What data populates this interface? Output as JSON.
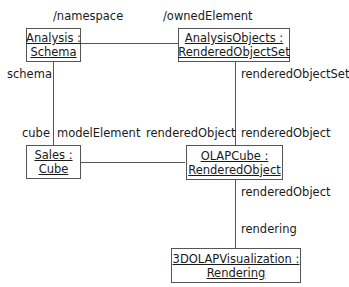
{
  "objects": [
    {
      "id": "analysis",
      "line1": "Analysis :",
      "line2": "Schema"
    },
    {
      "id": "analysis-objects",
      "line1": "AnalysisObjects :",
      "line2": "RenderedObjectSet"
    },
    {
      "id": "sales",
      "line1": "Sales :",
      "line2": "Cube"
    },
    {
      "id": "olapcube",
      "line1": "OLAPCube :",
      "line2": "RenderedObject"
    },
    {
      "id": "visualization",
      "line1": "3DOLAPVisualization :",
      "line2": "Rendering"
    }
  ],
  "roles": {
    "namespace": "/namespace",
    "owned_element": "/ownedElement",
    "schema": "schema",
    "cube": "cube",
    "model_element": "modelElement",
    "rendered_object_set": "renderedObjectSet",
    "rendered_object_left": "renderedObject",
    "rendered_object_right": "renderedObject",
    "rendered_object_bottom": "renderedObject",
    "rendering": "rendering"
  }
}
